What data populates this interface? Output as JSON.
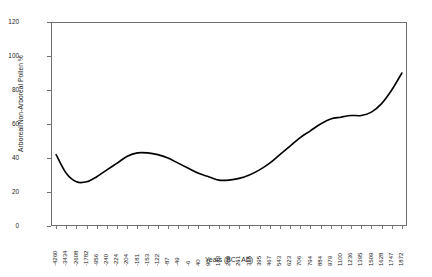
{
  "chart_data": {
    "type": "line",
    "title": "",
    "xlabel": "Years (BC - AD)",
    "ylabel": "Arboreal/Non-Arboreal Pollen %",
    "ylim": [
      0,
      120
    ],
    "yticks": [
      0,
      20,
      40,
      60,
      80,
      100,
      120
    ],
    "grid": false,
    "legend": "none",
    "line_color": "#000000",
    "frame_color": "#6f6f6f",
    "categories": [
      "-4260",
      "-3434",
      "-2608",
      "-1782",
      "-956",
      "-240",
      "-224",
      "-204",
      "-181",
      "-153",
      "-122",
      "-87",
      "-49",
      "-6",
      "40",
      "90",
      "143",
      "200",
      "261",
      "325",
      "395",
      "467",
      "543",
      "623",
      "706",
      "794",
      "884",
      "979",
      "1100",
      "1236",
      "1395",
      "1509",
      "1628",
      "1747",
      "1872"
    ],
    "values": [
      42,
      31,
      26,
      26,
      29,
      33,
      37,
      41,
      43,
      43,
      42,
      40,
      37,
      34,
      31,
      29,
      27,
      27,
      28,
      30,
      33,
      37,
      42,
      47,
      52,
      56,
      60,
      63,
      64,
      65,
      65,
      67,
      72,
      80,
      90
    ]
  }
}
